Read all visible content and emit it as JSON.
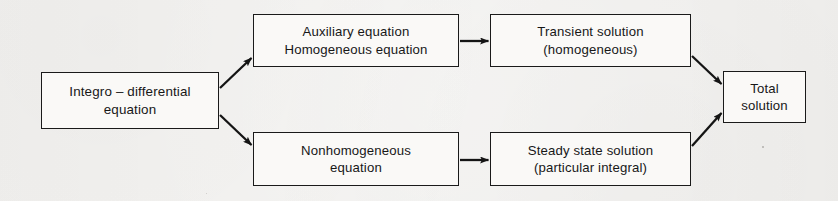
{
  "diagram": {
    "type": "flowchart",
    "background_color": "#f3f2f0",
    "line_color": "#1a1a1a",
    "text_color": "#171717",
    "nodes": [
      {
        "id": "integro",
        "name": "integro-differential-equation",
        "line1": "Integro – differential",
        "line2": "equation"
      },
      {
        "id": "auxiliary",
        "name": "auxiliary-equation",
        "line1": "Auxiliary equation",
        "line2": "Homogeneous  equation"
      },
      {
        "id": "transient",
        "name": "transient-solution",
        "line1": "Transient solution",
        "line2": "(homogeneous)"
      },
      {
        "id": "nonhomogeneous",
        "name": "nonhomogeneous-equation",
        "line1": "Nonhomogeneous",
        "line2": "equation"
      },
      {
        "id": "steady",
        "name": "steady-state-solution",
        "line1": "Steady  state  solution",
        "line2": "(particular  integral)"
      },
      {
        "id": "total",
        "name": "total-solution",
        "line1": "Total",
        "line2": "solution"
      }
    ],
    "edges": [
      {
        "from": "integro",
        "to": "auxiliary",
        "style": "diagonal-up",
        "arrowhead": true
      },
      {
        "from": "integro",
        "to": "nonhomogeneous",
        "style": "diagonal-down",
        "arrowhead": true
      },
      {
        "from": "auxiliary",
        "to": "transient",
        "style": "horizontal",
        "arrowhead": true
      },
      {
        "from": "nonhomogeneous",
        "to": "steady",
        "style": "horizontal",
        "arrowhead": true
      },
      {
        "from": "transient",
        "to": "total",
        "style": "diagonal-down",
        "arrowhead": true
      },
      {
        "from": "steady",
        "to": "total",
        "style": "diagonal-up",
        "arrowhead": true
      }
    ]
  }
}
